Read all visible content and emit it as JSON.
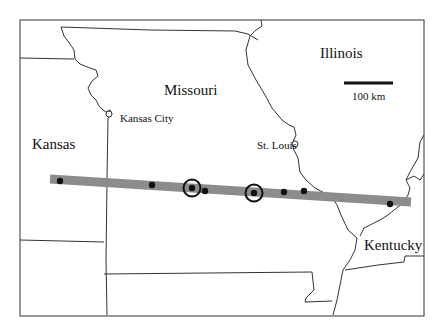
{
  "map": {
    "states": [
      {
        "name": "Illinois",
        "x": 320,
        "y": 46
      },
      {
        "name": "Missouri",
        "x": 164,
        "y": 83
      },
      {
        "name": "Kansas",
        "x": 32,
        "y": 137
      },
      {
        "name": "Kentucky",
        "x": 364,
        "y": 238
      }
    ],
    "cities": [
      {
        "name": "Kansas City",
        "x": 120,
        "y": 113
      },
      {
        "name": "St. Louis",
        "x": 258,
        "y": 141
      }
    ],
    "scale_bar": {
      "label": "100 km",
      "x1": 344,
      "x2": 393,
      "y": 83,
      "label_x": 352,
      "label_y": 91
    },
    "band": {
      "x1": 50,
      "y1": 179,
      "x2": 411,
      "y2": 202,
      "width": 9,
      "color": "#8c8c8c"
    },
    "points": [
      {
        "x": 60,
        "y": 181,
        "circled": false
      },
      {
        "x": 152,
        "y": 185,
        "circled": false
      },
      {
        "x": 192,
        "y": 188,
        "circled": true
      },
      {
        "x": 205,
        "y": 191,
        "circled": false
      },
      {
        "x": 254,
        "y": 193,
        "circled": true
      },
      {
        "x": 284,
        "y": 192,
        "circled": false
      },
      {
        "x": 304,
        "y": 191,
        "circled": false
      },
      {
        "x": 390,
        "y": 204,
        "circled": false
      }
    ],
    "colors": {
      "border": "#333333",
      "point": "#111111",
      "band": "#8c8c8c"
    }
  }
}
